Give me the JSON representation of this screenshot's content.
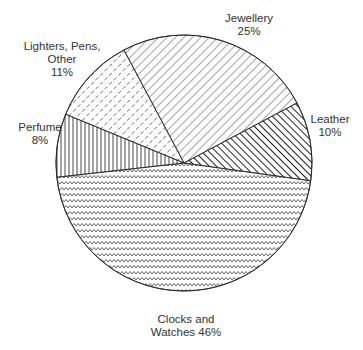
{
  "chart_data": {
    "type": "pie",
    "title": "",
    "center": [
      184,
      163
    ],
    "radius": 128,
    "start_angle_deg": 8,
    "direction": "clockwise",
    "slices": [
      {
        "name": "Clocks and Watches",
        "value": 46,
        "pattern": "zigzag",
        "label_lines": [
          "Clocks and",
          "Watches 46%"
        ],
        "label_pos": [
          186,
          313
        ]
      },
      {
        "name": "Perfume",
        "value": 8,
        "pattern": "vertical-lines",
        "label_lines": [
          "Perfume",
          "8%"
        ],
        "label_pos": [
          40,
          121
        ]
      },
      {
        "name": "Lighters, Pens, Other",
        "value": 11,
        "pattern": "dashes",
        "label_lines": [
          "Lighters, Pens,",
          "Other",
          "11%"
        ],
        "label_pos": [
          62,
          40
        ]
      },
      {
        "name": "Jewellery",
        "value": 25,
        "pattern": "diagonal-lines",
        "label_lines": [
          "Jewellery",
          "25%"
        ],
        "label_pos": [
          249,
          12
        ]
      },
      {
        "name": "Leather",
        "value": 10,
        "pattern": "bold-diagonal-lines",
        "label_lines": [
          "Leather",
          "10%"
        ],
        "label_pos": [
          330,
          113
        ]
      }
    ],
    "legend": "none",
    "unit": "%"
  },
  "colors": {
    "stroke": "#2a2a2a",
    "background": "#ffffff",
    "text": "#333333"
  }
}
